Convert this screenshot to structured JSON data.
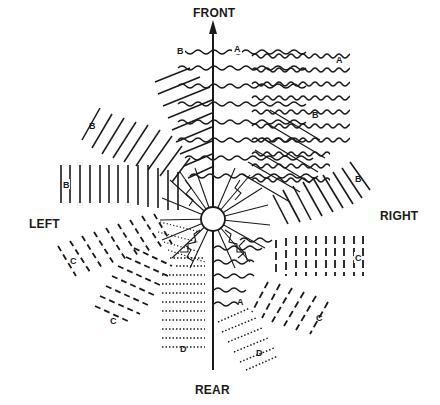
{
  "diagram": {
    "directions": {
      "front": "FRONT",
      "rear": "REAR",
      "left": "LEFT",
      "right": "RIGHT"
    },
    "center": {
      "x": 213,
      "y": 219,
      "radius": 12
    },
    "zones": [
      {
        "id": "A",
        "label": "A",
        "pattern": "wavy-lines",
        "sector": "front / front-right"
      },
      {
        "id": "A2",
        "label": "A",
        "pattern": "wavy-lines",
        "sector": "rear (near axis)"
      },
      {
        "id": "B-front-left",
        "label": "B",
        "pattern": "solid-lines",
        "sector": "front-left"
      },
      {
        "id": "B-left-upper",
        "label": "B",
        "pattern": "solid-lines",
        "sector": "left-front diagonal"
      },
      {
        "id": "B-left",
        "label": "B",
        "pattern": "solid-lines",
        "sector": "left"
      },
      {
        "id": "B-right",
        "label": "B",
        "pattern": "solid-lines",
        "sector": "right-front diagonal"
      },
      {
        "id": "B-front-right",
        "label": "B",
        "pattern": "solid-lines",
        "sector": "front-right (inner)"
      },
      {
        "id": "C-left",
        "label": "C",
        "pattern": "dashed-lines",
        "sector": "left-rear"
      },
      {
        "id": "C-left-lower",
        "label": "C",
        "pattern": "dashed-lines",
        "sector": "left-rear diagonal"
      },
      {
        "id": "C-right",
        "label": "C",
        "pattern": "dashed-lines",
        "sector": "right"
      },
      {
        "id": "C-right-lower",
        "label": "C",
        "pattern": "dashed-lines",
        "sector": "right-rear diagonal"
      },
      {
        "id": "D-left",
        "label": "D",
        "pattern": "dotted-lines",
        "sector": "rear-left"
      },
      {
        "id": "D-right",
        "label": "D",
        "pattern": "dotted-lines",
        "sector": "rear-right"
      }
    ],
    "colors": {
      "ink": "#1a1a1a",
      "background": "#ffffff"
    }
  }
}
